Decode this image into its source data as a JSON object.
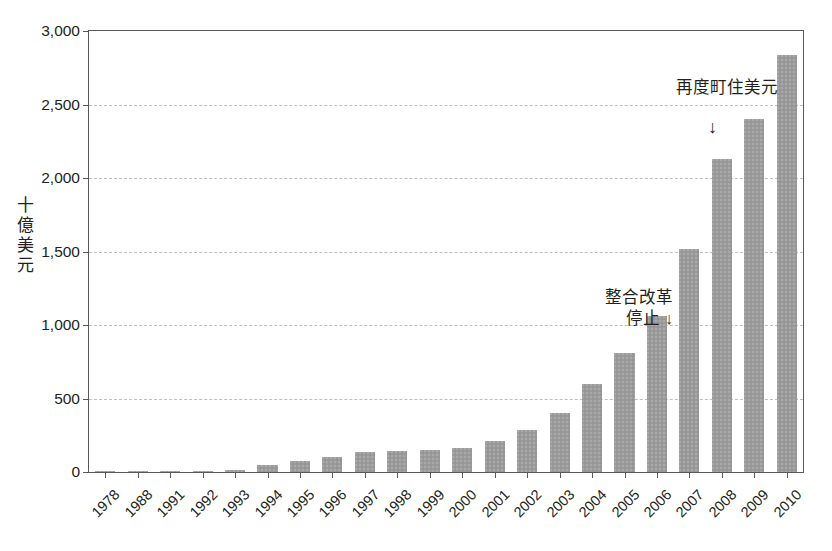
{
  "chart_data": {
    "type": "bar",
    "title": "",
    "subtitle": "",
    "xlabel": "",
    "ylabel": "十億美元",
    "ylim": [
      0,
      3000
    ],
    "ytick_values": [
      3000,
      2500,
      2000,
      1500,
      1000,
      500,
      0
    ],
    "ytick_labels": [
      "3,000",
      "2,500",
      "2,000",
      "1,500",
      "1,000",
      "500",
      "0"
    ],
    "grid": true,
    "legend": "none",
    "bar_color": "#9b9b9b",
    "categories": [
      "1978",
      "1988",
      "1991",
      "1992",
      "1993",
      "1994",
      "1995",
      "1996",
      "1997",
      "1998",
      "1999",
      "2000",
      "2001",
      "2002",
      "2003",
      "2004",
      "2005",
      "2006",
      "2007",
      "2008",
      "2009",
      "2010"
    ],
    "values": [
      3,
      5,
      10,
      8,
      15,
      45,
      75,
      105,
      135,
      145,
      150,
      160,
      210,
      285,
      400,
      600,
      810,
      1060,
      1520,
      2130,
      2400,
      2840
    ],
    "annotations": [
      {
        "id": "reform-halt",
        "text": "整合改革\n停止 ↓",
        "target_category": "2005",
        "arrow": "down-inline"
      },
      {
        "id": "housing-again",
        "text": "再度町住美元",
        "target_category": "2008",
        "arrow": "↓"
      }
    ]
  },
  "axis": {
    "y_title": "十\n億\n美\n元"
  }
}
